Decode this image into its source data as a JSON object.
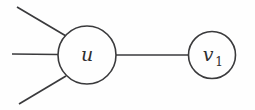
{
  "diagram": {
    "type": "graph",
    "background_color": "#fefefe",
    "stroke_color": "#3a3a3c",
    "label_color": "#2e2e30",
    "nodes": [
      {
        "id": "u",
        "label": "u",
        "subscript": "",
        "cx": 87,
        "cy": 55,
        "r": 29
      },
      {
        "id": "v1",
        "label": "v",
        "subscript": "1",
        "cx": 212,
        "cy": 55,
        "r": 23.5
      }
    ],
    "edges": [
      {
        "id": "edge-u-v1",
        "kind": "node-to-node",
        "x1": 116,
        "y1": 55,
        "x2": 188.5,
        "y2": 55
      },
      {
        "id": "edge-u-upper-left",
        "kind": "pendant",
        "x1": 17,
        "y1": 7,
        "x2": 66,
        "y2": 36
      },
      {
        "id": "edge-u-middle-left",
        "kind": "pendant",
        "x1": 12,
        "y1": 54,
        "x2": 58,
        "y2": 54.5
      },
      {
        "id": "edge-u-lower-left",
        "kind": "pendant",
        "x1": 19,
        "y1": 104,
        "x2": 66,
        "y2": 76
      }
    ]
  }
}
